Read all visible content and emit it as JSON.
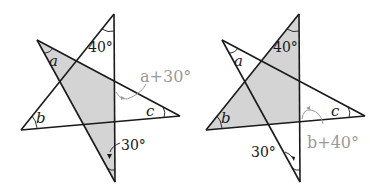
{
  "figures": [
    {
      "id": "left-star",
      "labels": {
        "a": "a",
        "b": "b",
        "c": "c",
        "top_angle": "40°",
        "bottom_angle": "30°",
        "exterior": "a+30°"
      }
    },
    {
      "id": "right-star",
      "labels": {
        "a": "a",
        "b": "b",
        "c": "c",
        "top_angle": "40°",
        "bottom_angle": "30°",
        "exterior": "b+40°"
      }
    }
  ],
  "colors": {
    "line": "#1a1a1a",
    "shade": "#d4d4d4",
    "annotation": "#9a9a9a"
  }
}
